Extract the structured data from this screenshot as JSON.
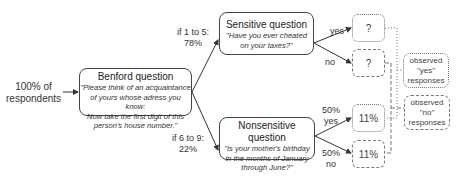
{
  "start": {
    "label_line1": "100% of",
    "label_line2": "respondents"
  },
  "benford": {
    "title": "Benford question",
    "question_lines": [
      "\"Please think of an acquaintance",
      "of yours whose adress you know:",
      "Now take the first digit of this",
      "person's house number.\""
    ]
  },
  "branches": {
    "upper": {
      "line1": "if 1 to 5:",
      "line2": "78%"
    },
    "lower": {
      "line1": "if 6 to 9:",
      "line2": "22%"
    }
  },
  "sensitive": {
    "title": "Sensitive question",
    "question_lines": [
      "\"Have you ever cheated",
      "on your taxes?\""
    ],
    "yes_label": "yes",
    "no_label": "no",
    "yes_value": "?",
    "no_value": "?"
  },
  "nonsensitive": {
    "title": "Nonsensitive question",
    "question_lines": [
      "\"Is your mother's birthday",
      "in the months of January",
      "through June?\""
    ],
    "yes_label_line1": "50%",
    "yes_label_line2": "yes",
    "no_label_line1": "50%",
    "no_label_line2": "no",
    "yes_value": "11%",
    "no_value": "11%"
  },
  "observed": {
    "yes": {
      "line1": "observed",
      "line2": "\"yes\"",
      "line3": "responses"
    },
    "no": {
      "line1": "observed",
      "line2": "\"no\"",
      "line3": "responses"
    }
  }
}
